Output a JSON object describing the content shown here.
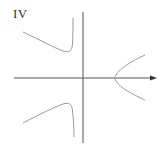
{
  "panel": {
    "label": "IV"
  },
  "colors": {
    "background": "#ffffff",
    "axis": "#555555",
    "curve": "#9a9a9a",
    "label": "#333333"
  },
  "axes": {
    "x_axis": {
      "y": 78,
      "x_start": 14,
      "x_end": 157,
      "arrow": true
    },
    "y_axis": {
      "x": 83,
      "y_start": 12,
      "y_end": 143,
      "arrow": false
    }
  },
  "curves": [
    {
      "name": "upper-left-branch",
      "description": "descends from left, turns up sharply at vertical asymptote left of y-axis"
    },
    {
      "name": "lower-left-branch",
      "description": "rises from left, turns down sharply at vertical asymptote left of y-axis"
    },
    {
      "name": "right-parabola",
      "description": "sideways parabola opening right with vertex on x-axis"
    }
  ]
}
